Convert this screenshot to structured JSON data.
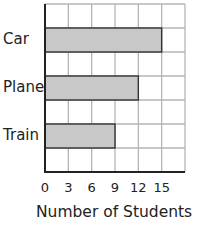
{
  "chart_data": {
    "type": "bar",
    "orientation": "horizontal",
    "title": "",
    "categories": [
      "Car",
      "Plane",
      "Train"
    ],
    "values": [
      15,
      12,
      9
    ],
    "xlabel": "Number of Students",
    "ylabel": "",
    "xticks": [
      "0",
      "3",
      "6",
      "9",
      "12",
      "15"
    ],
    "xlim": [
      0,
      18
    ],
    "grid": true,
    "bar_color": "#c8c8c8",
    "grid_color": "#b5b5b5"
  }
}
